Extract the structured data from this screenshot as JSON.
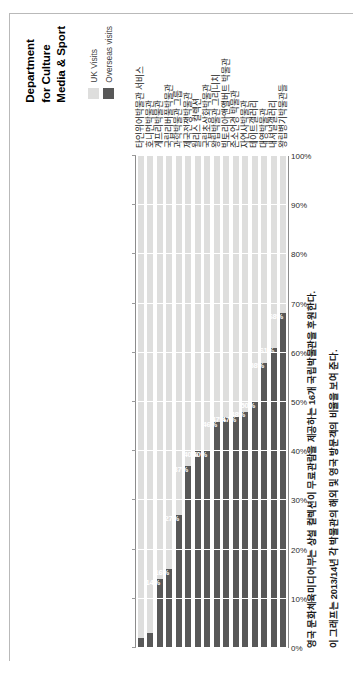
{
  "branding": {
    "line1": "Department",
    "line2": "for Culture",
    "line3": "Media & Sport"
  },
  "legend": {
    "items": [
      {
        "label": "UK Visits",
        "color": "#dededd"
      },
      {
        "label": "Overseas visits",
        "color": "#585858"
      }
    ]
  },
  "caption": {
    "line1": "영국 문화체육미디어부는 상설 컬렉션이 무료관람을 제공하는 16개 국립박물관을 후원한다.",
    "line2": "이 그래프는 2013/14년 각 박물관의 해외 및 영국 방문객의 비율을 보여 준다."
  },
  "chart_data": {
    "type": "bar",
    "orientation": "horizontal-stacked",
    "title": "",
    "xlabel": "",
    "ylabel": "",
    "xlim": [
      0,
      100
    ],
    "grid": true,
    "legend_position": "top-right",
    "tick_labels": [
      "0%",
      "10%",
      "20%",
      "30%",
      "40%",
      "50%",
      "60%",
      "70%",
      "80%",
      "90%",
      "100%"
    ],
    "categories": [
      "타인위어박물관 서비스",
      "호니먼박물관",
      "게프리박물관",
      "국립리버풀박물관",
      "과학박물관 그룹",
      "제국전쟁박물관",
      "월리스 컬렉션",
      "국립초상화박물관",
      "왕립박물관 그리니치",
      "빅토리아앤앨버트 박물관",
      "존소언경 박물관",
      "자연사박물관",
      "테이트갤러리",
      "대영박물관",
      "내셔널갤러리",
      "왕립병기박물관들"
    ],
    "series": [
      {
        "name": "Overseas visits",
        "color": "#585858",
        "values": [
          2,
          3,
          14,
          16,
          27,
          37,
          40,
          40,
          46,
          47,
          47,
          48,
          50,
          58,
          61,
          68
        ],
        "labels": [
          "",
          "",
          "14%",
          "16%",
          "27%",
          "37%",
          "40%",
          "40%",
          "46%",
          "47%",
          "47%",
          "48%",
          "50%",
          "58%",
          "61%",
          "68%"
        ]
      },
      {
        "name": "UK Visits",
        "color": "#dededd",
        "values": [
          98,
          97,
          86,
          84,
          73,
          63,
          60,
          60,
          54,
          53,
          53,
          52,
          50,
          42,
          39,
          32
        ],
        "labels": [
          "",
          "",
          "",
          "",
          "",
          "",
          "",
          "",
          "",
          "",
          "",
          "",
          "",
          "",
          "",
          ""
        ]
      }
    ]
  }
}
